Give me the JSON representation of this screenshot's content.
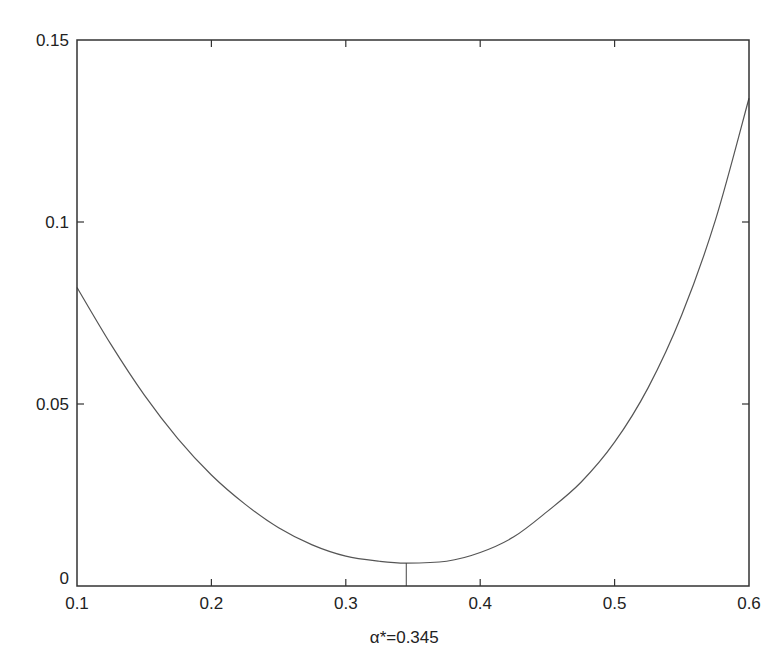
{
  "chart_data": {
    "type": "line",
    "title": "",
    "xlabel": "α*=0.345",
    "ylabel": "",
    "xlim": [
      0.1,
      0.6
    ],
    "ylim": [
      0,
      0.15
    ],
    "grid": false,
    "legend": null,
    "x_ticks": [
      0.1,
      0.2,
      0.3,
      0.4,
      0.5,
      0.6
    ],
    "x_tick_labels": [
      "0.1",
      "0.2",
      "0.3",
      "0.4",
      "0.5",
      "0.6"
    ],
    "y_ticks": [
      0,
      0.05,
      0.1,
      0.15
    ],
    "y_tick_labels": [
      "0",
      "0.05",
      "0.1",
      "0.15"
    ],
    "series": [
      {
        "name": "objective",
        "x": [
          0.1,
          0.125,
          0.15,
          0.175,
          0.2,
          0.225,
          0.25,
          0.275,
          0.3,
          0.325,
          0.345,
          0.375,
          0.4,
          0.425,
          0.45,
          0.475,
          0.5,
          0.525,
          0.55,
          0.575,
          0.6
        ],
        "values": [
          0.082,
          0.0665,
          0.0525,
          0.0405,
          0.0305,
          0.0225,
          0.016,
          0.0113,
          0.0082,
          0.0068,
          0.0063,
          0.0068,
          0.0092,
          0.0135,
          0.0205,
          0.0285,
          0.0395,
          0.0545,
          0.0745,
          0.1005,
          0.134
        ]
      }
    ],
    "annotations": [
      {
        "type": "vertical-marker",
        "x": 0.345,
        "y_from": 0,
        "y_to": 0.0063,
        "label": "α*=0.345"
      }
    ]
  },
  "axes": {
    "x_tick_labels": [
      "0.1",
      "0.2",
      "0.3",
      "0.4",
      "0.5",
      "0.6"
    ],
    "y_tick_labels": [
      "0",
      "0.05",
      "0.1",
      "0.15"
    ],
    "xlabel": "α*=0.345"
  },
  "colors": {
    "line": "#555555",
    "frame": "#333333",
    "text": "#222222"
  }
}
